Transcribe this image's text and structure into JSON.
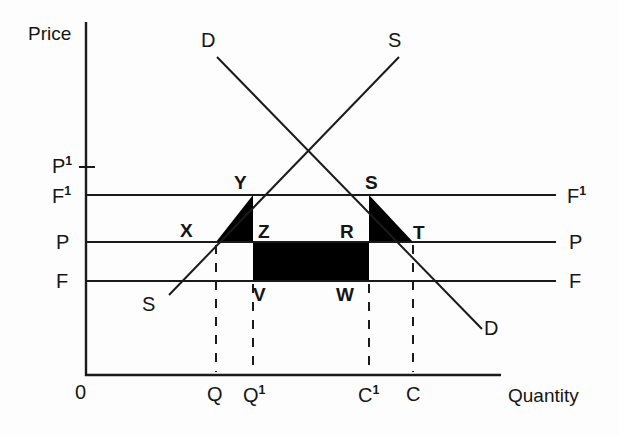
{
  "figure": {
    "type": "economics-supply-demand-diagram",
    "background_color": "#fdfdfd",
    "line_color": "#1a1a1a",
    "fill_color": "#000000"
  },
  "axes": {
    "y_title": "Price",
    "x_title": "Quantity",
    "origin_label": "0",
    "y_ticks": [
      {
        "id": "P1",
        "base": "P",
        "superscript": "1",
        "y": 165
      },
      {
        "id": "F1",
        "base": "F",
        "superscript": "1",
        "y": 195
      },
      {
        "id": "P",
        "base": "P",
        "superscript": "",
        "y": 242
      },
      {
        "id": "F",
        "base": "F",
        "superscript": "",
        "y": 281
      }
    ],
    "x_ticks": [
      {
        "id": "Q",
        "base": "Q",
        "superscript": "",
        "x": 216
      },
      {
        "id": "Q1",
        "base": "Q",
        "superscript": "1",
        "x": 253
      },
      {
        "id": "C1",
        "base": "C",
        "superscript": "1",
        "x": 369
      },
      {
        "id": "C",
        "base": "C",
        "superscript": "",
        "x": 413
      }
    ]
  },
  "right_labels": [
    {
      "id": "F1-right",
      "base": "F",
      "superscript": "1"
    },
    {
      "id": "P-right",
      "base": "P",
      "superscript": ""
    },
    {
      "id": "F-right",
      "base": "F",
      "superscript": ""
    }
  ],
  "curves": {
    "demand": {
      "label_top": "D",
      "label_bottom": "D",
      "description": "Downward sloping demand curve"
    },
    "supply": {
      "label_top": "S",
      "label_bottom": "S",
      "description": "Upward sloping supply curve"
    }
  },
  "points": [
    {
      "id": "Y",
      "label": "Y",
      "x": 240,
      "y": 174
    },
    {
      "id": "S",
      "label": "S",
      "x": 371,
      "y": 174
    },
    {
      "id": "X",
      "label": "X",
      "x": 186,
      "y": 223
    },
    {
      "id": "Z",
      "label": "Z",
      "x": 263,
      "y": 224
    },
    {
      "id": "R",
      "label": "R",
      "x": 345,
      "y": 224
    },
    {
      "id": "T",
      "label": "T",
      "x": 418,
      "y": 225
    },
    {
      "id": "V",
      "label": "V",
      "x": 258,
      "y": 288
    },
    {
      "id": "W",
      "label": "W",
      "x": 343,
      "y": 288
    }
  ],
  "shaded_regions": [
    {
      "id": "left-triangle",
      "name": "deadweight-triangle-XYZ",
      "fill": "#000000"
    },
    {
      "id": "center-rectangle",
      "name": "transfer-rectangle-ZRWV",
      "fill": "#000000"
    },
    {
      "id": "right-triangle",
      "name": "deadweight-triangle-SRT",
      "fill": "#000000"
    }
  ]
}
